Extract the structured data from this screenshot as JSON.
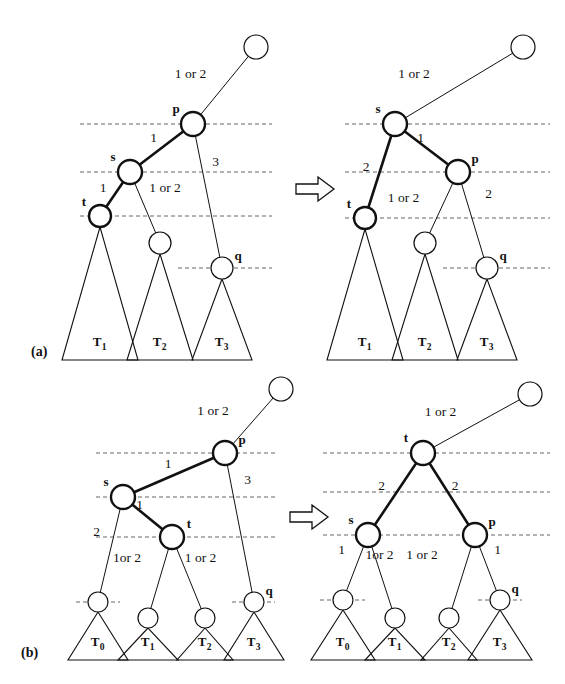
{
  "figure": {
    "type": "tree-rotation-diagram",
    "background": "#ffffff",
    "stroke": "#111111",
    "dash_color": "#666666",
    "panels": [
      {
        "id": "a",
        "label": "(a)",
        "transform_arrow": "rightwards-open-arrow",
        "before": {
          "caption": "single rotation input",
          "nodes": [
            {
              "id": "free_top",
              "label": "",
              "x": 256,
              "y": 47,
              "r": 12,
              "bold": false,
              "label_pos": ""
            },
            {
              "id": "p",
              "label": "p",
              "x": 193,
              "y": 124,
              "r": 12,
              "bold": true,
              "label_pos": "left-top"
            },
            {
              "id": "s",
              "label": "s",
              "x": 130,
              "y": 172,
              "r": 12,
              "bold": true,
              "label_pos": "left-top"
            },
            {
              "id": "t",
              "label": "t",
              "x": 100,
              "y": 216,
              "r": 11,
              "bold": true,
              "label_pos": "left-top"
            },
            {
              "id": "m2",
              "label": "",
              "x": 160,
              "y": 243,
              "r": 11,
              "bold": false,
              "label_pos": ""
            },
            {
              "id": "q",
              "label": "q",
              "x": 222,
              "y": 268,
              "r": 11,
              "bold": false,
              "label_pos": "right-top"
            }
          ],
          "edges": [
            {
              "from": "p",
              "to": "free_top",
              "label": "1 or 2",
              "bold": false,
              "label_dx": -34,
              "label_dy": -8
            },
            {
              "from": "s",
              "to": "p",
              "label": "1",
              "bold": true,
              "label_dx": -8,
              "label_dy": -6
            },
            {
              "from": "t",
              "to": "s",
              "label": "1",
              "bold": true,
              "label_dx": -12,
              "label_dy": -2
            },
            {
              "from": "s",
              "to": "m2",
              "label": "1 or 2",
              "bold": false,
              "label_dx": 20,
              "label_dy": -16
            },
            {
              "from": "p",
              "to": "q",
              "label": "3",
              "bold": false,
              "label_dx": 8,
              "label_dy": -30
            }
          ],
          "dashed_levels": [
            {
              "y": 124,
              "x1": 80,
              "x2": 272
            },
            {
              "y": 172,
              "x1": 80,
              "x2": 272
            },
            {
              "y": 216,
              "x1": 80,
              "x2": 272
            },
            {
              "y": 268,
              "x1": 178,
              "x2": 272
            }
          ],
          "subtrees": [
            {
              "label": "T",
              "sub": "1",
              "apex_x": 100,
              "apex_y": 227,
              "half_width": 38,
              "base_y": 360
            },
            {
              "label": "T",
              "sub": "2",
              "apex_x": 160,
              "apex_y": 254,
              "half_width": 33,
              "base_y": 360
            },
            {
              "label": "T",
              "sub": "3",
              "apex_x": 222,
              "apex_y": 279,
              "half_width": 30,
              "base_y": 360
            }
          ]
        },
        "after": {
          "caption": "single rotation result",
          "nodes": [
            {
              "id": "free_top",
              "label": "",
              "x": 523,
              "y": 47,
              "r": 12,
              "bold": false,
              "label_pos": ""
            },
            {
              "id": "s",
              "label": "s",
              "x": 395,
              "y": 124,
              "r": 12,
              "bold": true,
              "label_pos": "left-top"
            },
            {
              "id": "p",
              "label": "p",
              "x": 458,
              "y": 172,
              "r": 12,
              "bold": true,
              "label_pos": "right-top"
            },
            {
              "id": "t",
              "label": "t",
              "x": 365,
              "y": 218,
              "r": 11,
              "bold": true,
              "label_pos": "left-top"
            },
            {
              "id": "m2",
              "label": "",
              "x": 425,
              "y": 243,
              "r": 11,
              "bold": false,
              "label_pos": ""
            },
            {
              "id": "q",
              "label": "q",
              "x": 487,
              "y": 268,
              "r": 11,
              "bold": false,
              "label_pos": "right-top"
            }
          ],
          "edges": [
            {
              "from": "s",
              "to": "free_top",
              "label": "1 or 2",
              "bold": false,
              "label_dx": -45,
              "label_dy": -8
            },
            {
              "from": "s",
              "to": "p",
              "label": "1",
              "bold": true,
              "label_dx": -6,
              "label_dy": -6
            },
            {
              "from": "s",
              "to": "t",
              "label": "2",
              "bold": true,
              "label_dx": -14,
              "label_dy": 0
            },
            {
              "from": "p",
              "to": "m2",
              "label": "1 or 2",
              "bold": false,
              "label_dx": -38,
              "label_dy": -6
            },
            {
              "from": "p",
              "to": "q",
              "label": "2",
              "bold": false,
              "label_dx": 16,
              "label_dy": -22
            }
          ],
          "dashed_levels": [
            {
              "y": 124,
              "x1": 345,
              "x2": 550
            },
            {
              "y": 172,
              "x1": 345,
              "x2": 550
            },
            {
              "y": 218,
              "x1": 345,
              "x2": 550
            },
            {
              "y": 268,
              "x1": 443,
              "x2": 550
            }
          ],
          "subtrees": [
            {
              "label": "T",
              "sub": "1",
              "apex_x": 365,
              "apex_y": 229,
              "half_width": 38,
              "base_y": 360
            },
            {
              "label": "T",
              "sub": "2",
              "apex_x": 425,
              "apex_y": 254,
              "half_width": 33,
              "base_y": 360
            },
            {
              "label": "T",
              "sub": "3",
              "apex_x": 487,
              "apex_y": 279,
              "half_width": 30,
              "base_y": 360
            }
          ]
        }
      },
      {
        "id": "b",
        "label": "(b)",
        "transform_arrow": "rightwards-open-arrow",
        "before": {
          "caption": "double rotation input",
          "nodes": [
            {
              "id": "free_top",
              "label": "",
              "x": 281,
              "y": 389,
              "r": 12,
              "bold": false,
              "label_pos": ""
            },
            {
              "id": "p",
              "label": "p",
              "x": 225,
              "y": 453,
              "r": 12,
              "bold": true,
              "label_pos": "right-top"
            },
            {
              "id": "s",
              "label": "s",
              "x": 123,
              "y": 497,
              "r": 12,
              "bold": true,
              "label_pos": "left-top"
            },
            {
              "id": "t",
              "label": "t",
              "x": 172,
              "y": 537,
              "r": 12,
              "bold": true,
              "label_pos": "right-top"
            },
            {
              "id": "m0",
              "label": "",
              "x": 98,
              "y": 602,
              "r": 10,
              "bold": false,
              "label_pos": ""
            },
            {
              "id": "m1",
              "label": "",
              "x": 148,
              "y": 618,
              "r": 10,
              "bold": false,
              "label_pos": ""
            },
            {
              "id": "m2",
              "label": "",
              "x": 205,
              "y": 618,
              "r": 10,
              "bold": false,
              "label_pos": ""
            },
            {
              "id": "q",
              "label": "q",
              "x": 254,
              "y": 602,
              "r": 10,
              "bold": false,
              "label_pos": "right-top"
            }
          ],
          "edges": [
            {
              "from": "p",
              "to": "free_top",
              "label": "1 or 2",
              "bold": false,
              "label_dx": -40,
              "label_dy": -6
            },
            {
              "from": "s",
              "to": "p",
              "label": "1",
              "bold": true,
              "label_dx": -6,
              "label_dy": -7
            },
            {
              "from": "s",
              "to": "t",
              "label": "1",
              "bold": true,
              "label_dx": -8,
              "label_dy": -8
            },
            {
              "from": "s",
              "to": "m0",
              "label": "2",
              "bold": false,
              "label_dx": -14,
              "label_dy": -14
            },
            {
              "from": "t",
              "to": "m1",
              "label": "1or 2",
              "bold": false,
              "label_dx": -33,
              "label_dy": -16
            },
            {
              "from": "t",
              "to": "m2",
              "label": "1 or 2",
              "bold": false,
              "label_dx": 12,
              "label_dy": -16
            },
            {
              "from": "p",
              "to": "q",
              "label": "3",
              "bold": false,
              "label_dx": 8,
              "label_dy": -44
            }
          ],
          "dashed_levels": [
            {
              "y": 453,
              "x1": 96,
              "x2": 275
            },
            {
              "y": 497,
              "x1": 96,
              "x2": 275
            },
            {
              "y": 537,
              "x1": 96,
              "x2": 275
            },
            {
              "y": 602,
              "x1": 76,
              "x2": 120
            },
            {
              "y": 602,
              "x1": 232,
              "x2": 275
            }
          ],
          "subtrees": [
            {
              "label": "T",
              "sub": "0",
              "apex_x": 98,
              "apex_y": 612,
              "half_width": 30,
              "base_y": 660
            },
            {
              "label": "T",
              "sub": "1",
              "apex_x": 148,
              "apex_y": 628,
              "half_width": 30,
              "base_y": 660
            },
            {
              "label": "T",
              "sub": "2",
              "apex_x": 205,
              "apex_y": 628,
              "half_width": 28,
              "base_y": 660
            },
            {
              "label": "T",
              "sub": "3",
              "apex_x": 254,
              "apex_y": 612,
              "half_width": 30,
              "base_y": 660
            }
          ]
        },
        "after": {
          "caption": "double rotation result",
          "nodes": [
            {
              "id": "free_top",
              "label": "",
              "x": 530,
              "y": 394,
              "r": 12,
              "bold": false,
              "label_pos": ""
            },
            {
              "id": "t",
              "label": "t",
              "x": 423,
              "y": 453,
              "r": 12,
              "bold": true,
              "label_pos": "left-top"
            },
            {
              "id": "s",
              "label": "s",
              "x": 368,
              "y": 535,
              "r": 12,
              "bold": true,
              "label_pos": "left-top"
            },
            {
              "id": "p",
              "label": "p",
              "x": 475,
              "y": 535,
              "r": 12,
              "bold": true,
              "label_pos": "right-top"
            },
            {
              "id": "m0",
              "label": "",
              "x": 343,
              "y": 600,
              "r": 10,
              "bold": false,
              "label_pos": ""
            },
            {
              "id": "m1",
              "label": "",
              "x": 395,
              "y": 618,
              "r": 10,
              "bold": false,
              "label_pos": ""
            },
            {
              "id": "m2",
              "label": "",
              "x": 449,
              "y": 618,
              "r": 10,
              "bold": false,
              "label_pos": ""
            },
            {
              "id": "q",
              "label": "q",
              "x": 500,
              "y": 600,
              "r": 10,
              "bold": false,
              "label_pos": "right-top"
            }
          ],
          "edges": [
            {
              "from": "t",
              "to": "free_top",
              "label": "1 or 2",
              "bold": false,
              "label_dx": -36,
              "label_dy": -8
            },
            {
              "from": "t",
              "to": "s",
              "label": "2",
              "bold": true,
              "label_dx": -14,
              "label_dy": -4
            },
            {
              "from": "t",
              "to": "p",
              "label": "2",
              "bold": true,
              "label_dx": 6,
              "label_dy": -4
            },
            {
              "from": "s",
              "to": "m0",
              "label": "1",
              "bold": false,
              "label_dx": -14,
              "label_dy": -14
            },
            {
              "from": "s",
              "to": "m1",
              "label": "1or 2",
              "bold": false,
              "label_dx": -2,
              "label_dy": -18
            },
            {
              "from": "p",
              "to": "m2",
              "label": "1 or 2",
              "bold": false,
              "label_dx": -40,
              "label_dy": -18
            },
            {
              "from": "p",
              "to": "q",
              "label": "1",
              "bold": false,
              "label_dx": 10,
              "label_dy": -14
            }
          ],
          "dashed_levels": [
            {
              "y": 453,
              "x1": 323,
              "x2": 550
            },
            {
              "y": 492,
              "x1": 323,
              "x2": 550
            },
            {
              "y": 535,
              "x1": 323,
              "x2": 550
            },
            {
              "y": 600,
              "x1": 320,
              "x2": 365
            },
            {
              "y": 600,
              "x1": 478,
              "x2": 522
            }
          ],
          "subtrees": [
            {
              "label": "T",
              "sub": "0",
              "apex_x": 343,
              "apex_y": 610,
              "half_width": 32,
              "base_y": 660
            },
            {
              "label": "T",
              "sub": "1",
              "apex_x": 395,
              "apex_y": 628,
              "half_width": 30,
              "base_y": 660
            },
            {
              "label": "T",
              "sub": "2",
              "apex_x": 449,
              "apex_y": 628,
              "half_width": 28,
              "base_y": 660
            },
            {
              "label": "T",
              "sub": "3",
              "apex_x": 500,
              "apex_y": 610,
              "half_width": 32,
              "base_y": 660
            }
          ]
        }
      }
    ],
    "arrows": [
      {
        "id": "arrow-a",
        "x": 296,
        "y": 177,
        "w": 38,
        "h": 24
      },
      {
        "id": "arrow-b",
        "x": 290,
        "y": 505,
        "w": 38,
        "h": 24
      }
    ]
  }
}
